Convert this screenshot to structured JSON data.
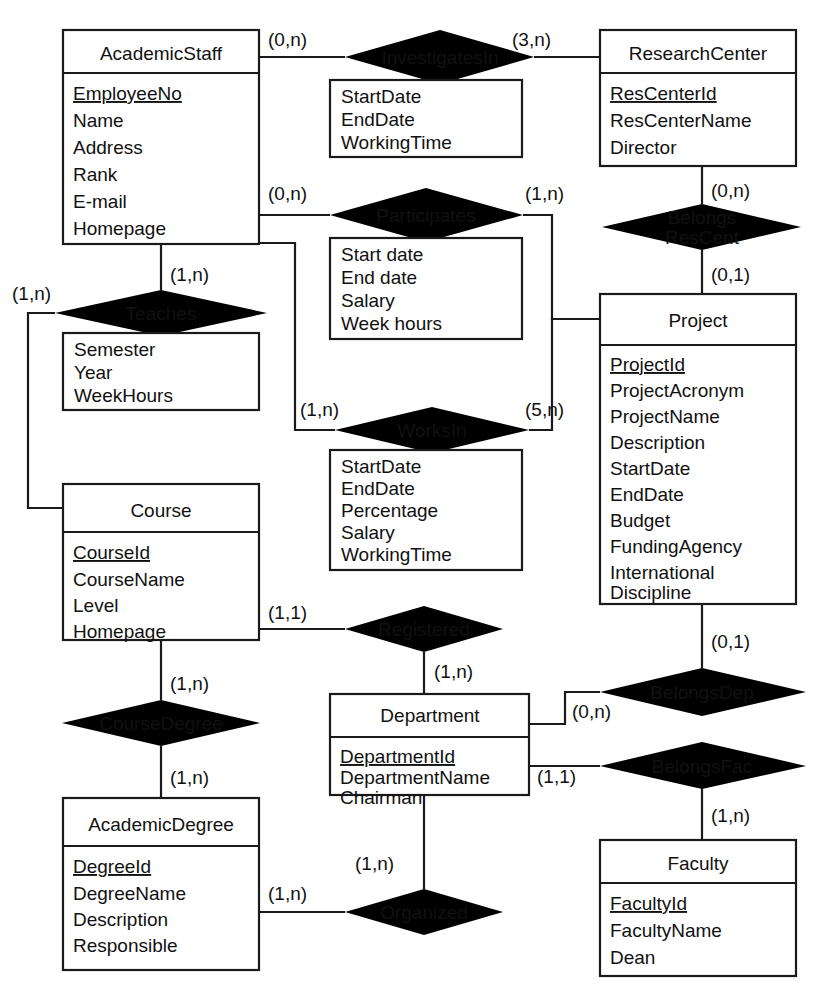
{
  "diagram": {
    "notation": "chen-min-max",
    "stroke_color": "#1a1a1a",
    "background_color": "#ffffff"
  },
  "entities": [
    {
      "id": "academic-staff",
      "name": "AcademicStaff",
      "attributes": [
        "EmployeeNo",
        "Name",
        "Address",
        "Rank",
        "E-mail",
        "Homepage"
      ],
      "key_attribute": "EmployeeNo"
    },
    {
      "id": "research-center",
      "name": "ResearchCenter",
      "attributes": [
        "ResCenterId",
        "ResCenterName",
        "Director"
      ],
      "key_attribute": "ResCenterId"
    },
    {
      "id": "project",
      "name": "Project",
      "attributes": [
        "ProjectId",
        "ProjectAcronym",
        "ProjectName",
        "Description",
        "StartDate",
        "EndDate",
        "Budget",
        "FundingAgency",
        "International",
        "Discipline"
      ],
      "key_attribute": "ProjectId"
    },
    {
      "id": "course",
      "name": "Course",
      "attributes": [
        "CourseId",
        "CourseName",
        "Level",
        "Homepage"
      ],
      "key_attribute": "CourseId"
    },
    {
      "id": "department",
      "name": "Department",
      "attributes": [
        "DepartmentId",
        "DepartmentName",
        "Chairman"
      ],
      "key_attribute": "DepartmentId"
    },
    {
      "id": "academic-degree",
      "name": "AcademicDegree",
      "attributes": [
        "DegreeId",
        "DegreeName",
        "Description",
        "Responsible"
      ],
      "key_attribute": "DegreeId"
    },
    {
      "id": "faculty",
      "name": "Faculty",
      "attributes": [
        "FacultyId",
        "FacultyName",
        "Dean"
      ],
      "key_attribute": "FacultyId"
    }
  ],
  "relationships": [
    {
      "id": "investigates-in",
      "name": "InvestigatesIn",
      "name_lines": [
        "InvestigatesIn"
      ],
      "attributes": [
        "StartDate",
        "EndDate",
        "WorkingTime"
      ],
      "cardinalities": [
        "(0,n)",
        "(3,n)"
      ]
    },
    {
      "id": "participates",
      "name": "Participates",
      "name_lines": [
        "Participates"
      ],
      "attributes": [
        "Start date",
        "End date",
        "Salary",
        "Week hours"
      ],
      "cardinalities": [
        "(0,n)",
        "(1,n)"
      ]
    },
    {
      "id": "belongs-res-cent",
      "name": "BelongsResCent",
      "name_lines": [
        "Belongs",
        "ResCent"
      ],
      "attributes": [],
      "cardinalities": [
        "(0,n)",
        "(0,1)"
      ]
    },
    {
      "id": "teaches",
      "name": "Teaches",
      "name_lines": [
        "Teaches"
      ],
      "attributes": [
        "Semester",
        "Year",
        "WeekHours"
      ],
      "cardinalities": [
        "(1,n)",
        "(1,n)"
      ]
    },
    {
      "id": "works-in",
      "name": "WorksIn",
      "name_lines": [
        "WorksIn"
      ],
      "attributes": [
        "StartDate",
        "EndDate",
        "Percentage",
        "Salary",
        "WorkingTime"
      ],
      "cardinalities": [
        "(1,n)",
        "(5,n)"
      ]
    },
    {
      "id": "registered",
      "name": "Registered",
      "name_lines": [
        "Registered"
      ],
      "attributes": [],
      "cardinalities": [
        "(1,1)",
        "(1,n)"
      ]
    },
    {
      "id": "course-degree",
      "name": "CourseDegree",
      "name_lines": [
        "CourseDegree"
      ],
      "attributes": [],
      "cardinalities": [
        "(1,n)",
        "(1,n)"
      ]
    },
    {
      "id": "belongs-dep",
      "name": "BelongsDep",
      "name_lines": [
        "BelongsDep"
      ],
      "attributes": [],
      "cardinalities": [
        "(0,1)",
        "(0,n)"
      ]
    },
    {
      "id": "belongs-fac",
      "name": "BelongsFac",
      "name_lines": [
        "BelongsFac"
      ],
      "attributes": [],
      "cardinalities": [
        "(1,1)",
        "(1,n)"
      ]
    },
    {
      "id": "organized",
      "name": "Organized",
      "name_lines": [
        "Organized"
      ],
      "attributes": [],
      "cardinalities": [
        "(1,n)",
        "(1,n)"
      ]
    }
  ],
  "cardinality_labels": {
    "staff_investigates": "(0,n)",
    "center_investigates": "(3,n)",
    "staff_participates": "(0,n)",
    "project_participates": "(1,n)",
    "center_belongs": "(0,n)",
    "project_belongs": "(0,1)",
    "staff_teaches": "(1,n)",
    "course_teaches": "(1,n)",
    "staff_worksin": "(1,n)",
    "project_worksin": "(5,n)",
    "course_registered": "(1,1)",
    "dept_registered": "(1,n)",
    "course_degree": "(1,n)",
    "degree_course": "(1,n)",
    "project_belongsdep": "(0,1)",
    "dept_belongsdep": "(0,n)",
    "dept_belongsfac": "(1,1)",
    "faculty_belongsfac": "(1,n)",
    "dept_organized": "(1,n)",
    "degree_organized": "(1,n)"
  }
}
